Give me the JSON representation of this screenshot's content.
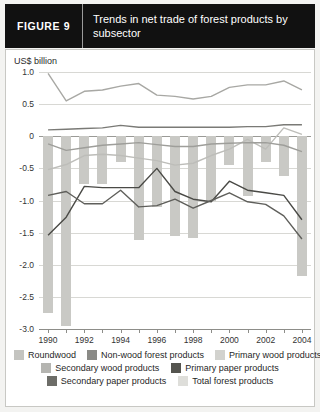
{
  "header": {
    "figure_tag": "FIGURE  9",
    "title": "Trends in net trade of forest products by subsector"
  },
  "axis_unit_label": "US$ billion",
  "chart_data": {
    "type": "line",
    "title": "Trends in net trade of forest products by subsector",
    "xlabel": "",
    "ylabel": "US$ billion",
    "ylim": [
      -3.0,
      1.0
    ],
    "grid": true,
    "legend_position": "bottom",
    "x": [
      1990,
      1991,
      1992,
      1993,
      1994,
      1995,
      1996,
      1997,
      1998,
      1999,
      2000,
      2001,
      2002,
      2003,
      2004
    ],
    "xtick_labels": [
      "1990",
      "1992",
      "1994",
      "1996",
      "1998",
      "2000",
      "2002",
      "2004"
    ],
    "ytick_labels": [
      "1.0",
      "0.5",
      "0",
      "-0.5",
      "-1.0",
      "-1.5",
      "-2.0",
      "-2.5",
      "-3.0"
    ],
    "ytick_values": [
      1.0,
      0.5,
      0,
      -0.5,
      -1.0,
      -1.5,
      -2.0,
      -2.5,
      -3.0
    ],
    "series": [
      {
        "name": "Total forest products",
        "kind": "bar",
        "color": "#c9c9c5",
        "values": [
          -2.75,
          -2.95,
          -0.75,
          -0.75,
          -0.4,
          -1.62,
          -1.1,
          -1.55,
          -1.58,
          -1.0,
          -0.45,
          -0.93,
          -0.4,
          -0.62,
          -2.18
        ]
      },
      {
        "name": "Roundwood",
        "kind": "line",
        "color": "#a8a8a4",
        "values": [
          0.98,
          0.55,
          0.7,
          0.72,
          0.78,
          0.82,
          0.64,
          0.62,
          0.58,
          0.62,
          0.76,
          0.8,
          0.8,
          0.86,
          0.72
        ]
      },
      {
        "name": "Non-wood forest products",
        "kind": "line",
        "color": "#7a7a76",
        "values": [
          0.1,
          0.11,
          0.12,
          0.13,
          0.17,
          0.14,
          0.14,
          0.14,
          0.14,
          0.14,
          0.14,
          0.15,
          0.15,
          0.18,
          0.18
        ]
      },
      {
        "name": "Primary wood products",
        "kind": "line",
        "color": "#bdbdb9",
        "values": [
          -0.52,
          -0.44,
          -0.3,
          -0.28,
          -0.3,
          -0.34,
          -0.38,
          -0.45,
          -0.42,
          -0.3,
          -0.2,
          -0.05,
          -0.2,
          0.13,
          0.03
        ]
      },
      {
        "name": "Secondary wood products",
        "kind": "line",
        "color": "#9e9e9a",
        "values": [
          -0.12,
          -0.22,
          -0.18,
          -0.14,
          -0.12,
          -0.1,
          -0.13,
          -0.16,
          -0.16,
          -0.12,
          -0.11,
          -0.1,
          -0.1,
          -0.14,
          -0.24
        ]
      },
      {
        "name": "Primary paper products",
        "kind": "line",
        "color": "#4a4a46",
        "values": [
          -1.54,
          -1.26,
          -0.78,
          -0.8,
          -0.8,
          -0.8,
          -0.5,
          -0.86,
          -0.98,
          -1.02,
          -0.7,
          -0.84,
          -0.88,
          -0.92,
          -1.3
        ]
      },
      {
        "name": "Secondary paper products",
        "kind": "line",
        "color": "#5f5f5b",
        "values": [
          -0.92,
          -0.86,
          -1.05,
          -1.05,
          -0.84,
          -1.1,
          -1.08,
          -0.98,
          -1.12,
          -1.0,
          -0.88,
          -1.02,
          -1.06,
          -1.24,
          -1.6
        ]
      }
    ]
  },
  "legend": {
    "rows": [
      [
        {
          "label": "Roundwood",
          "color": "#c4c4c0"
        },
        {
          "label": "Non-wood forest products",
          "color": "#8a8a86"
        },
        {
          "label": "Primary wood products",
          "color": "#d2d2ce"
        }
      ],
      [
        {
          "label": "Secondary wood products",
          "color": "#b5b5b1"
        },
        {
          "label": "Primary paper products",
          "color": "#55554f"
        }
      ],
      [
        {
          "label": "Secondary paper products",
          "color": "#6d6d68"
        },
        {
          "label": "Total forest products",
          "color": "#dededa"
        }
      ]
    ]
  }
}
